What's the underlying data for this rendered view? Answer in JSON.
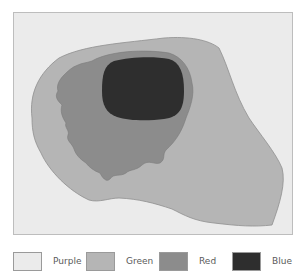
{
  "diagram": {
    "regions": [
      {
        "name": "Purple",
        "color": "#ebebeb",
        "role": "background"
      },
      {
        "name": "Green",
        "color": "#b5b5b5",
        "role": "outer-region"
      },
      {
        "name": "Red",
        "color": "#8c8c8c",
        "role": "middle-region"
      },
      {
        "name": "Blue",
        "color": "#2e2e2e",
        "role": "core-region"
      }
    ]
  },
  "legend": {
    "items": [
      {
        "label": "Purple",
        "color": "#ebebeb"
      },
      {
        "label": "Green",
        "color": "#b5b5b5"
      },
      {
        "label": "Red",
        "color": "#8c8c8c"
      },
      {
        "label": "Blue",
        "color": "#2e2e2e"
      }
    ]
  }
}
